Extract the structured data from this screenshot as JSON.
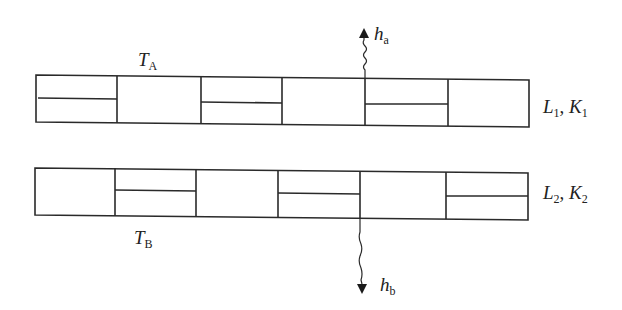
{
  "diagram": {
    "type": "two parallel layered strips with heat-flux arrows",
    "strips": [
      {
        "id": "strip-1",
        "label_main": "L",
        "label_sub": "1",
        "label_sep": ", ",
        "label_main2": "K",
        "label_sub2": "1",
        "side_label": "L1, K1",
        "cells": [
          {
            "index": 1,
            "split": true
          },
          {
            "index": 2,
            "split": false
          },
          {
            "index": 3,
            "split": true
          },
          {
            "index": 4,
            "split": false
          },
          {
            "index": 5,
            "split": true
          },
          {
            "index": 6,
            "split": false
          }
        ],
        "temperature_label": {
          "main": "T",
          "sub": "A"
        }
      },
      {
        "id": "strip-2",
        "label_main": "L",
        "label_sub": "2",
        "label_sep": ", ",
        "label_main2": "K",
        "label_sub2": "2",
        "side_label": "L2, K2",
        "cells": [
          {
            "index": 1,
            "split": false
          },
          {
            "index": 2,
            "split": true
          },
          {
            "index": 3,
            "split": false
          },
          {
            "index": 4,
            "split": true
          },
          {
            "index": 5,
            "split": false
          },
          {
            "index": 6,
            "split": true
          }
        ],
        "temperature_label": {
          "main": "T",
          "sub": "B"
        }
      }
    ],
    "arrows": [
      {
        "id": "h-a",
        "direction": "up",
        "label_main": "h",
        "label_sub": "a"
      },
      {
        "id": "h-b",
        "direction": "down",
        "label_main": "h",
        "label_sub": "b"
      }
    ]
  }
}
